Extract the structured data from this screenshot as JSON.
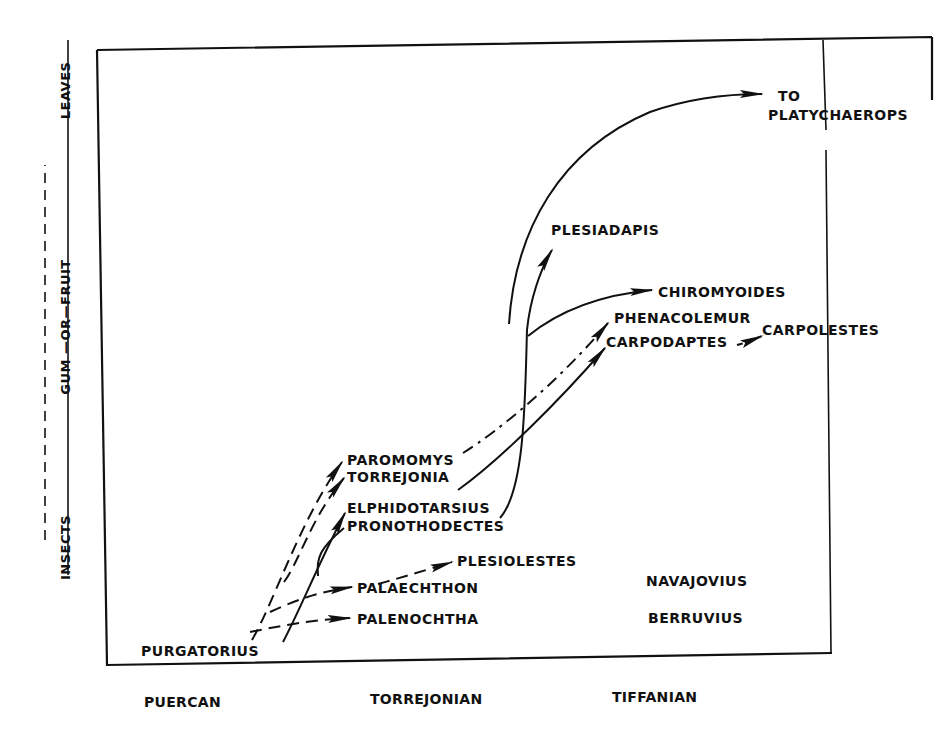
{
  "figure": {
    "y_axis": {
      "bottom_label": "INSECTS",
      "middle_labels": [
        "GUM",
        "OR",
        "FRUIT"
      ],
      "top_label": "LEAVES",
      "line_styles": {
        "insects_to_leaves": "solid",
        "gum": "dotted/dashed",
        "fruit": "dash-dot"
      }
    },
    "x_axis": {
      "epochs": [
        "PUERCAN",
        "TORREJONIAN",
        "TIFFANIAN"
      ]
    },
    "taxa": {
      "purgatorius": "PURGATORIUS",
      "palenochtha": "PALENOCHTHA",
      "palaechthon": "PALAECHTHON",
      "plesiolestes": "PLESIOLESTES",
      "elphidotarsius": "ELPHIDOTARSIUS",
      "pronothodectes": "PRONOTHODECTES",
      "paromomys": "PAROMOMYS",
      "torrejonia": "TORREJONIA",
      "plesiadapis": "PLESIADAPIS",
      "chiromyoides": "CHIROMYOIDES",
      "phenacolemur": "PHENACOLEMUR",
      "carpodaptes": "CARPODAPTES",
      "carpolestes": "CARPOLESTES",
      "navajovius": "NAVAJOVIUS",
      "berruvius": "BERRUVIUS",
      "to_line1": "TO",
      "to_line2": "PLATYCHAEROPS"
    },
    "lineages": [
      {
        "from": "PURGATORIUS",
        "to": "PALENOCHTHA",
        "style": "dashed"
      },
      {
        "from": "PURGATORIUS",
        "to": "PALAECHTHON",
        "style": "dashed"
      },
      {
        "from": "PURGATORIUS",
        "to": "PAROMOMYS",
        "style": "dashed"
      },
      {
        "from": "PURGATORIUS",
        "to": "TORREJONIA",
        "style": "dashed"
      },
      {
        "from": "PURGATORIUS",
        "to": "ELPHIDOTARSIUS",
        "style": "solid"
      },
      {
        "from": "PURGATORIUS",
        "to": "PRONOTHODECTES",
        "style": "solid"
      },
      {
        "from": "PALAECHTHON",
        "to": "PLESIOLESTES",
        "style": "dashed"
      },
      {
        "from": "PAROMOMYS",
        "to": "PHENACOLEMUR",
        "style": "dashed"
      },
      {
        "from": "ELPHIDOTARSIUS",
        "to": "CARPODAPTES",
        "style": "solid"
      },
      {
        "from": "PRONOTHODECTES",
        "to": "PLESIADAPIS",
        "style": "solid"
      },
      {
        "from": "PRONOTHODECTES",
        "to": "CHIROMYOIDES",
        "style": "solid"
      },
      {
        "from": "PLESIADAPIS",
        "to": "TO PLATYCHAEROPS",
        "style": "solid"
      },
      {
        "from": "CARPODAPTES",
        "to": "CARPOLESTES",
        "style": "dashed"
      }
    ],
    "colors": {
      "ink": "#111111",
      "paper": "#ffffff"
    }
  }
}
